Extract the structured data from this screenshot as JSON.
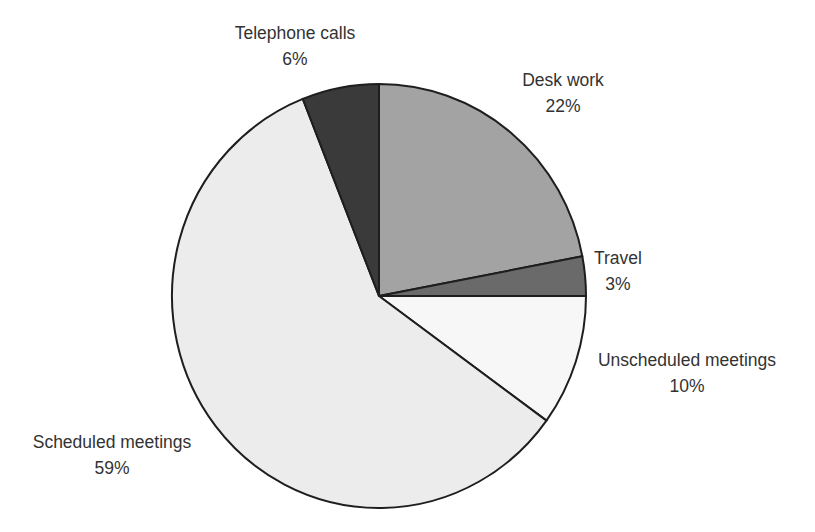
{
  "chart_data": {
    "type": "pie",
    "title": "",
    "start_angle_deg": 0,
    "direction": "clockwise",
    "slices": [
      {
        "label": "Desk work",
        "value": 22,
        "display": "22%",
        "color": "#a3a3a3",
        "label_pos": [
          563,
          86
        ]
      },
      {
        "label": "Travel",
        "value": 3,
        "display": "3%",
        "color": "#6a6a6a",
        "label_pos": [
          618,
          264
        ]
      },
      {
        "label": "Unscheduled meetings",
        "value": 10,
        "display": "10%",
        "color": "#f7f7f7",
        "label_pos": [
          687,
          366
        ]
      },
      {
        "label": "Scheduled meetings",
        "value": 59,
        "display": "59%",
        "color": "#ececec",
        "label_pos": [
          112,
          448
        ]
      },
      {
        "label": "Telephone calls",
        "value": 6,
        "display": "6%",
        "color": "#3a3a3a",
        "label_pos": [
          295,
          39
        ]
      }
    ],
    "legend": "none",
    "data_labels": "category name and percentage, outside slices"
  },
  "geometry": {
    "cx": 379,
    "cy": 296,
    "rx": 207,
    "ry": 212
  }
}
